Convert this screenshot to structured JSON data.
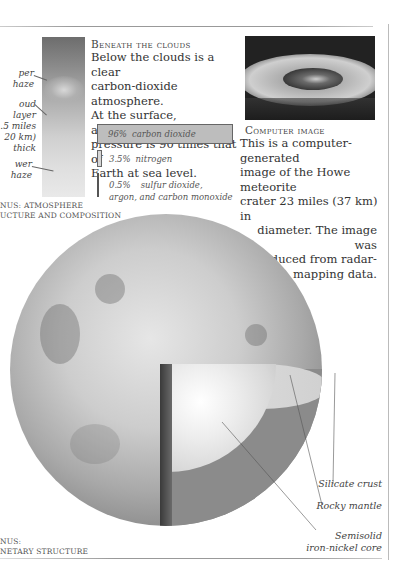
{
  "atmosphere_panel": {
    "labels": {
      "upper_haze": "Upper haze",
      "cloud_layer": [
        "Cloud layer",
        "12.5 miles",
        "(20 km)",
        "thick"
      ],
      "lower_haze": "Lower haze"
    },
    "visible_labels": {
      "upper_haze": "per haze",
      "cloud_layer_1": "oud layer",
      "cloud_layer_2": ".5 miles",
      "cloud_layer_3": "20 km)",
      "cloud_layer_4": "thick",
      "lower_haze": "wer haze"
    },
    "caption_line1": "NUS: ATMOSPHERE",
    "caption_line2": "UCTURE AND COMPOSITION"
  },
  "beneath_clouds": {
    "heading": "Beneath the clouds",
    "body": [
      "Below the clouds is a clear",
      "carbon-dioxide atmosphere.",
      "At the surface, atmospheric",
      "pressure is 90 times that of",
      "Earth at sea level."
    ],
    "composition": [
      {
        "percent": "96%",
        "label": "carbon dioxide",
        "value": 96
      },
      {
        "percent": "3.5%",
        "label": "nitrogen",
        "value": 3.5
      },
      {
        "percent": "0.5%",
        "label": "sulfur dioxide,",
        "label2": "argon, and carbon monoxide",
        "value": 0.5
      }
    ]
  },
  "computer_image": {
    "heading": "Computer image",
    "body": [
      "This is a computer-generated",
      "image of the Howe meteorite",
      "crater 23 miles (37 km) in",
      "diameter. The image was",
      "produced from radar-",
      "mapping data."
    ]
  },
  "planet_structure": {
    "labels": {
      "crust": "Silicate crust",
      "mantle": "Rocky mantle",
      "core_1": "Semisolid",
      "core_2": "iron-nickel core"
    },
    "caption_line1": "NUS:",
    "caption_line2": "NETARY STRUCTURE"
  },
  "colors": {
    "text": "#333333",
    "rule": "#999999",
    "bar_fill": "#bdbdbd"
  }
}
